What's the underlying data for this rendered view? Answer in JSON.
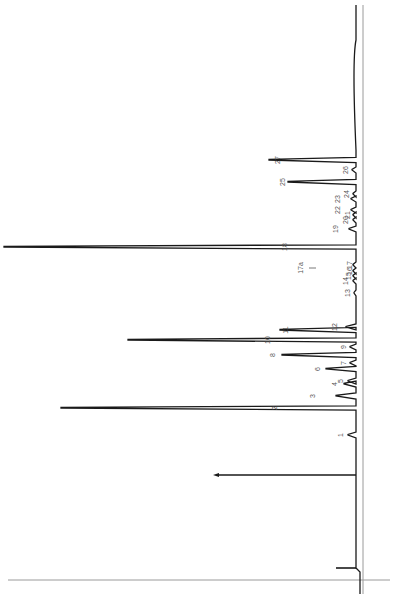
{
  "chart_data": {
    "type": "line",
    "title": "",
    "subtitle": "",
    "xlabel": "",
    "ylabel": "",
    "orientation": "rotated-90 (retention time runs bottom-to-top, detector response extends leftward)",
    "grid": false,
    "legend": null,
    "colors": {
      "trace": "#1a1a1a",
      "axis": "#888888",
      "label": "#555555",
      "background": "#ffffff"
    },
    "baseline_x": 356,
    "injection": {
      "y": 568,
      "x_start": 336,
      "x_end": 361
    },
    "marker_arrow": {
      "y": 475,
      "x_from": 356,
      "x_to": 213
    },
    "peaks": [
      {
        "id": "1",
        "y": 435,
        "height_px": 8,
        "label_x": 343
      },
      {
        "id": "2",
        "y": 408,
        "height_px": 295,
        "label_x": 277
      },
      {
        "id": "3",
        "y": 396,
        "height_px": 20,
        "label_x": 315
      },
      {
        "id": "4",
        "y": 384,
        "height_px": 12,
        "label_x": 337
      },
      {
        "id": "5",
        "y": 381,
        "height_px": 8,
        "label_x": 343
      },
      {
        "id": "6",
        "y": 369,
        "height_px": 30,
        "label_x": 320
      },
      {
        "id": "7",
        "y": 363,
        "height_px": 6,
        "label_x": 346
      },
      {
        "id": "8",
        "y": 355,
        "height_px": 74,
        "label_x": 275
      },
      {
        "id": "9",
        "y": 347,
        "height_px": 6,
        "label_x": 346
      },
      {
        "id": "10",
        "y": 340,
        "height_px": 228,
        "label_x": 270
      },
      {
        "id": "11",
        "y": 330,
        "height_px": 76,
        "label_x": 288
      },
      {
        "id": "12",
        "y": 327,
        "height_px": 10,
        "label_x": 337
      },
      {
        "id": "13",
        "y": 293,
        "height_px": 2,
        "label_x": 350
      },
      {
        "id": "14",
        "y": 281,
        "height_px": 3,
        "label_x": 348
      },
      {
        "id": "15",
        "y": 276,
        "height_px": 3,
        "label_x": 351
      },
      {
        "id": "16",
        "y": 271,
        "height_px": 3,
        "label_x": 352
      },
      {
        "id": "17",
        "y": 265,
        "height_px": 3,
        "label_x": 352
      },
      {
        "id": "17a",
        "y": 268,
        "height_px": 0,
        "label_x": 303,
        "label": "17a"
      },
      {
        "id": "18",
        "y": 247,
        "height_px": 352,
        "label_x": 287
      },
      {
        "id": "19",
        "y": 229,
        "height_px": 7,
        "label_x": 338
      },
      {
        "id": "20",
        "y": 220,
        "height_px": 3,
        "label_x": 348
      },
      {
        "id": "21",
        "y": 215,
        "height_px": 3,
        "label_x": 350
      },
      {
        "id": "22",
        "y": 210,
        "height_px": 5,
        "label_x": 340
      },
      {
        "id": "23",
        "y": 199,
        "height_px": 5,
        "label_x": 340
      },
      {
        "id": "24",
        "y": 194,
        "height_px": 3,
        "label_x": 349
      },
      {
        "id": "25",
        "y": 182,
        "height_px": 68,
        "label_x": 285
      },
      {
        "id": "26",
        "y": 170,
        "height_px": 4,
        "label_x": 348
      },
      {
        "id": "27",
        "y": 160,
        "height_px": 87,
        "label_x": 280
      }
    ]
  }
}
